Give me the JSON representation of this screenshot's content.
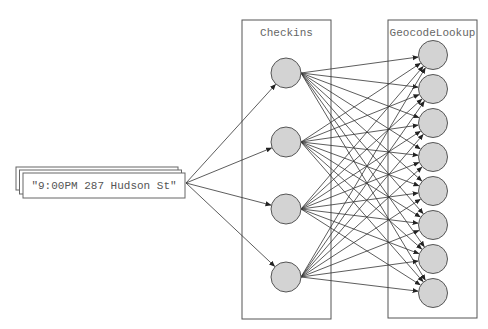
{
  "diagram": {
    "input": {
      "label": "\"9:00PM 287 Hudson St\"",
      "stack_count": 3
    },
    "layers": [
      {
        "title": "Checkins",
        "node_count": 4
      },
      {
        "title": "GeocodeLookup",
        "node_count": 8
      }
    ],
    "connections": {
      "input_to_checkins": "one-to-all",
      "checkins_to_geocodelookup": "all-to-all"
    },
    "colors": {
      "node_fill": "#d3d3d3",
      "node_stroke": "#555555",
      "edge": "#333333",
      "box_stroke": "#555555",
      "text": "#666666"
    }
  }
}
